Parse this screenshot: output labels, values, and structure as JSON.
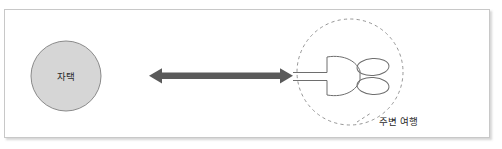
{
  "page": {
    "clipped_top_text": "ᅳ ᅳ   ᅳ  ᅳᅳ"
  },
  "figure": {
    "home_node": {
      "label": "자택",
      "shape": "circle",
      "fill_color": "#d6d6d6",
      "stroke_color": "#8a8a8a"
    },
    "destination_node": {
      "caption": "주변 여행",
      "shape": "dashed-circle",
      "stroke_color": "#8a8a8a",
      "icon_name": "tree-plant-icon",
      "icon_stroke_color": "#6e6e6e"
    },
    "connector": {
      "type": "double-headed-arrow",
      "color": "#5a5a5a",
      "direction": "bidirectional"
    },
    "panel": {
      "border_color": "#c8c8c8",
      "background_color": "#ffffff"
    }
  }
}
